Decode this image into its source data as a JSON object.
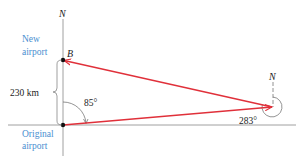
{
  "labels": {
    "north_left": "N",
    "north_right": "N",
    "point_b": "B",
    "new_airport_line1": "New",
    "new_airport_line2": "airport",
    "original_airport_line1": "Original",
    "original_airport_line2": "airport",
    "distance": "230 km",
    "angle_left": "85°",
    "angle_right": "283°"
  },
  "colors": {
    "vector": "#e0303a",
    "axis": "#555555",
    "label_blue": "#4a8fd0",
    "text": "#222222"
  }
}
